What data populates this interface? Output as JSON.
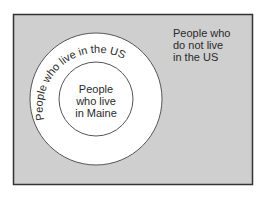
{
  "diagram": {
    "type": "euler",
    "colors": {
      "universe_fill": "#cfcfcf",
      "border": "#333333",
      "circle_fill": "#ffffff",
      "circle_stroke": "#555555",
      "text": "#2a2a2a"
    },
    "universe": {
      "label_lines": [
        "People who",
        "do not live",
        "in the US"
      ]
    },
    "outer_set": {
      "label": "People who live in the US"
    },
    "inner_set": {
      "label_lines": [
        "People",
        "who live",
        "in Maine"
      ]
    }
  }
}
